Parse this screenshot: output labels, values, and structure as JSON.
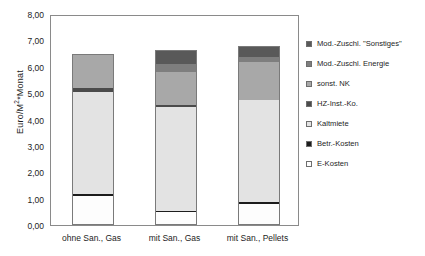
{
  "chart_data": {
    "type": "bar",
    "stacked": true,
    "title": "",
    "xlabel": "",
    "ylabel": "Euro/M²*Monat",
    "ylim": [
      0,
      8
    ],
    "ytick_step": 1,
    "ytick_labels": [
      "0,00",
      "1,00",
      "2,00",
      "3,00",
      "4,00",
      "5,00",
      "6,00",
      "7,00",
      "8,00"
    ],
    "ytick_values": [
      0,
      1,
      2,
      3,
      4,
      5,
      6,
      7,
      8
    ],
    "grid": false,
    "legend_position": "right",
    "categories": [
      "ohne San., Gas",
      "mit San., Gas",
      "mit San., Pellets"
    ],
    "series": [
      {
        "name": "E-Kosten",
        "color": "#fdfdfd",
        "values": [
          1.1,
          0.48,
          0.8
        ]
      },
      {
        "name": "Betr.-Kosten",
        "color": "#1c1c1c",
        "values": [
          0.08,
          0.07,
          0.08
        ]
      },
      {
        "name": "Kaltmiete",
        "color": "#e3e3e3",
        "values": [
          3.87,
          3.92,
          3.87
        ]
      },
      {
        "name": "HZ-Inst.-Ko.",
        "color": "#4b4b4b",
        "values": [
          0.13,
          0.08,
          0.0
        ]
      },
      {
        "name": "sonst. NK",
        "color": "#a8a8a8",
        "values": [
          1.3,
          1.25,
          1.42
        ]
      },
      {
        "name": "Mod.-Zuschl. Energie",
        "color": "#7e7e7e",
        "values": [
          0.0,
          0.3,
          0.22
        ]
      },
      {
        "name": "Mod.-Zuschl. \"Sonstiges\"",
        "color": "#595959",
        "values": [
          0.0,
          0.53,
          0.39
        ]
      }
    ],
    "totals": [
      6.48,
      6.63,
      6.78
    ]
  },
  "legend": {
    "items": [
      {
        "label": "Mod.-Zuschl. \"Sonstiges\"",
        "color": "#595959"
      },
      {
        "label": "Mod.-Zuschl. Energie",
        "color": "#7e7e7e"
      },
      {
        "label": "sonst. NK",
        "color": "#a8a8a8"
      },
      {
        "label": "HZ-Inst.-Ko.",
        "color": "#4b4b4b"
      },
      {
        "label": "Kaltmiete",
        "color": "#e3e3e3"
      },
      {
        "label": "Betr.-Kosten",
        "color": "#1c1c1c"
      },
      {
        "label": "E-Kosten",
        "color": "#fdfdfd"
      }
    ]
  },
  "axis": {
    "y_title_main": "Euro/M",
    "y_title_sup": "2",
    "y_title_tail": "*Monat"
  }
}
